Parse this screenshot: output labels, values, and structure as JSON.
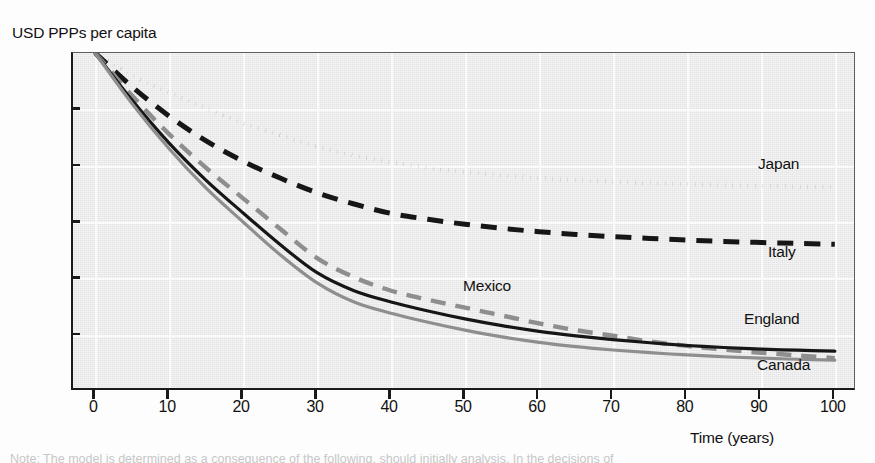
{
  "chart_data": {
    "type": "line",
    "title": "",
    "ylabel": "USD PPPs per capita",
    "xlabel": "Time (years)",
    "xlim": [
      -3,
      103
    ],
    "ylim": [
      -150,
      0
    ],
    "grid": true,
    "legend_position": "right-inline-labels",
    "xticks": [
      "0",
      "10",
      "20",
      "30",
      "40",
      "50",
      "60",
      "70",
      "80",
      "90",
      "100"
    ],
    "xtick_values": [
      0,
      10,
      20,
      30,
      40,
      50,
      60,
      70,
      80,
      90,
      100
    ],
    "yticks": [
      "0",
      "-25",
      "-50",
      "-75",
      "-100",
      "-125",
      "-150"
    ],
    "ytick_values": [
      0,
      -25,
      -50,
      -75,
      -100,
      -125,
      -150
    ],
    "x": [
      0,
      5,
      10,
      15,
      20,
      25,
      30,
      35,
      40,
      45,
      50,
      55,
      60,
      65,
      70,
      75,
      80,
      85,
      90,
      95,
      100
    ],
    "series": [
      {
        "name": "Japan",
        "style": "dotted",
        "color": "#161616",
        "values": [
          0,
          -10,
          -17.5,
          -24.5,
          -31,
          -36.5,
          -41.5,
          -45.5,
          -48.5,
          -51,
          -52.8,
          -54.3,
          -55.5,
          -56.4,
          -57.1,
          -57.7,
          -58.2,
          -58.6,
          -59,
          -59.3,
          -59.6
        ]
      },
      {
        "name": "Italy",
        "style": "dashed",
        "color": "#161616",
        "values": [
          0,
          -15,
          -28,
          -39,
          -48,
          -55.5,
          -62,
          -67,
          -71.2,
          -73.8,
          -76,
          -77.8,
          -79.3,
          -80.5,
          -81.5,
          -82.3,
          -83,
          -83.6,
          -84.1,
          -84.5,
          -84.9
        ]
      },
      {
        "name": "Mexico",
        "style": "dashed-gray",
        "color": "#8e8e8e",
        "values": [
          0,
          -19,
          -36,
          -51,
          -64.5,
          -78,
          -91,
          -99.5,
          -105.5,
          -109.5,
          -113,
          -116.5,
          -120,
          -123,
          -125.5,
          -128,
          -130,
          -131.6,
          -133,
          -134.2,
          -135.4
        ]
      },
      {
        "name": "England",
        "style": "solid",
        "color": "#161616",
        "values": [
          0,
          -21,
          -40,
          -56.5,
          -71,
          -85,
          -97.5,
          -105.5,
          -110.5,
          -114.5,
          -118,
          -121,
          -123.5,
          -125.5,
          -127.2,
          -128.6,
          -129.8,
          -130.7,
          -131.4,
          -131.9,
          -132.3
        ]
      },
      {
        "name": "Canada",
        "style": "solid-gray",
        "color": "#8e8e8e",
        "values": [
          0,
          -22.5,
          -42.5,
          -60,
          -75,
          -89.5,
          -102,
          -110.5,
          -115.5,
          -119.5,
          -123,
          -126,
          -128.4,
          -130.3,
          -131.8,
          -133,
          -134,
          -134.8,
          -135.4,
          -135.9,
          -136.3
        ]
      }
    ],
    "series_label_positions": [
      {
        "name": "Japan",
        "left": 758,
        "top": 155
      },
      {
        "name": "Italy",
        "left": 768,
        "top": 243
      },
      {
        "name": "Mexico",
        "left": 463,
        "top": 277
      },
      {
        "name": "England",
        "left": 744,
        "top": 310
      },
      {
        "name": "Canada",
        "left": 757,
        "top": 356
      }
    ]
  },
  "footnote": {
    "text": "Note: The model is determined as a consequence of the following, should initially analysis. In the decisions of"
  },
  "colors": {
    "plot_background": "#ebebeb",
    "gridline": "#fafafa",
    "axis": "#1a1a1a",
    "dark_series": "#161616",
    "gray_series": "#8e8e8e",
    "text": "#111111"
  }
}
